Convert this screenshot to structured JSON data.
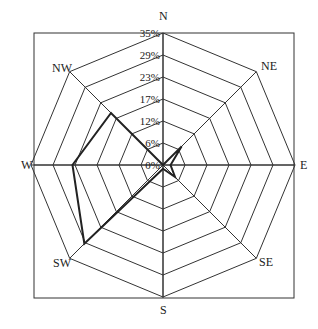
{
  "chart_data": {
    "type": "radar",
    "title": "",
    "directions": [
      "N",
      "NE",
      "E",
      "SE",
      "S",
      "SW",
      "W",
      "NW"
    ],
    "ring_labels": [
      "0%",
      "6%",
      "12%",
      "17%",
      "23%",
      "29%",
      "35%"
    ],
    "rmax": 35,
    "series": [
      {
        "name": "wind frequency",
        "values": [
          0,
          7,
          2,
          4.5,
          1,
          29.5,
          24,
          19.5
        ]
      }
    ],
    "frame": true
  }
}
